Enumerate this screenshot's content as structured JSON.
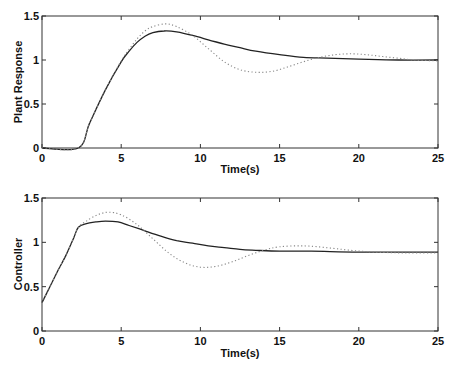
{
  "chart_data": [
    {
      "type": "line",
      "title": "",
      "xlabel": "Time(s)",
      "ylabel": "Plant Response",
      "xlim": [
        0,
        25
      ],
      "ylim": [
        0,
        1.5
      ],
      "xticks": [
        "0",
        "5",
        "10",
        "15",
        "20",
        "25"
      ],
      "yticks": [
        "0",
        "0.5",
        "1",
        "1.5"
      ],
      "grid": false,
      "legend": null,
      "series": [
        {
          "name": "solid",
          "style": "solid",
          "x": [
            0,
            2.3,
            3,
            4,
            5,
            5.5,
            6,
            6.5,
            7,
            7.7,
            8.5,
            9.5,
            10.5,
            11.5,
            12.5,
            13.5,
            15,
            16.5,
            18,
            20,
            22.5,
            25
          ],
          "y": [
            0,
            0,
            0.28,
            0.66,
            0.98,
            1.1,
            1.2,
            1.27,
            1.31,
            1.33,
            1.32,
            1.28,
            1.23,
            1.18,
            1.14,
            1.1,
            1.06,
            1.03,
            1.02,
            1.01,
            1.0,
            1.0
          ]
        },
        {
          "name": "dotted",
          "style": "dotted",
          "x": [
            0,
            2.3,
            3,
            4,
            5,
            5.5,
            6,
            6.5,
            7,
            7.8,
            8.5,
            9.5,
            10.5,
            11.5,
            12.5,
            13.5,
            14.5,
            15.5,
            16.5,
            17.5,
            18.5,
            19.5,
            20.5,
            21.5,
            22.5,
            23.5,
            25
          ],
          "y": [
            0,
            0,
            0.28,
            0.66,
            0.99,
            1.12,
            1.24,
            1.33,
            1.38,
            1.41,
            1.38,
            1.28,
            1.13,
            0.98,
            0.89,
            0.86,
            0.87,
            0.92,
            0.98,
            1.03,
            1.06,
            1.07,
            1.06,
            1.04,
            1.02,
            1.0,
            0.99
          ]
        }
      ]
    },
    {
      "type": "line",
      "title": "",
      "xlabel": "Time(s)",
      "ylabel": "Controller",
      "xlim": [
        0,
        25
      ],
      "ylim": [
        0,
        1.5
      ],
      "xticks": [
        "0",
        "5",
        "10",
        "15",
        "20",
        "25"
      ],
      "yticks": [
        "0",
        "0.5",
        "1",
        "1.5"
      ],
      "grid": false,
      "legend": null,
      "series": [
        {
          "name": "solid",
          "style": "solid",
          "x": [
            0,
            0.5,
            1,
            1.5,
            2,
            2.3,
            2.8,
            3.4,
            4,
            4.8,
            5.5,
            6.5,
            7.5,
            8.5,
            9.5,
            10.5,
            11.5,
            12.5,
            13.5,
            15,
            17,
            20,
            25
          ],
          "y": [
            0.32,
            0.5,
            0.68,
            0.85,
            1.05,
            1.17,
            1.21,
            1.23,
            1.24,
            1.23,
            1.19,
            1.13,
            1.07,
            1.02,
            0.99,
            0.96,
            0.94,
            0.92,
            0.91,
            0.9,
            0.9,
            0.89,
            0.89
          ]
        },
        {
          "name": "dotted",
          "style": "dotted",
          "x": [
            0,
            0.5,
            1,
            1.5,
            2,
            2.3,
            2.8,
            3.5,
            4.2,
            5,
            6,
            7,
            8,
            9,
            10,
            11,
            12,
            13,
            14,
            15,
            16.5,
            18,
            19.5,
            21,
            23,
            25
          ],
          "y": [
            0.32,
            0.5,
            0.68,
            0.85,
            1.05,
            1.17,
            1.24,
            1.31,
            1.34,
            1.31,
            1.2,
            1.04,
            0.88,
            0.77,
            0.72,
            0.73,
            0.78,
            0.85,
            0.91,
            0.95,
            0.96,
            0.94,
            0.91,
            0.89,
            0.88,
            0.88
          ]
        }
      ]
    }
  ]
}
